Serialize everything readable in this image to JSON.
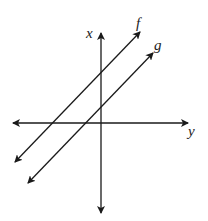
{
  "diagram": {
    "axes": {
      "vertical_label": "x",
      "horizontal_label": "y"
    },
    "lines": [
      {
        "label": "f"
      },
      {
        "label": "g"
      }
    ],
    "colors": {
      "stroke": "#1a1a1a",
      "background": "#ffffff"
    }
  }
}
